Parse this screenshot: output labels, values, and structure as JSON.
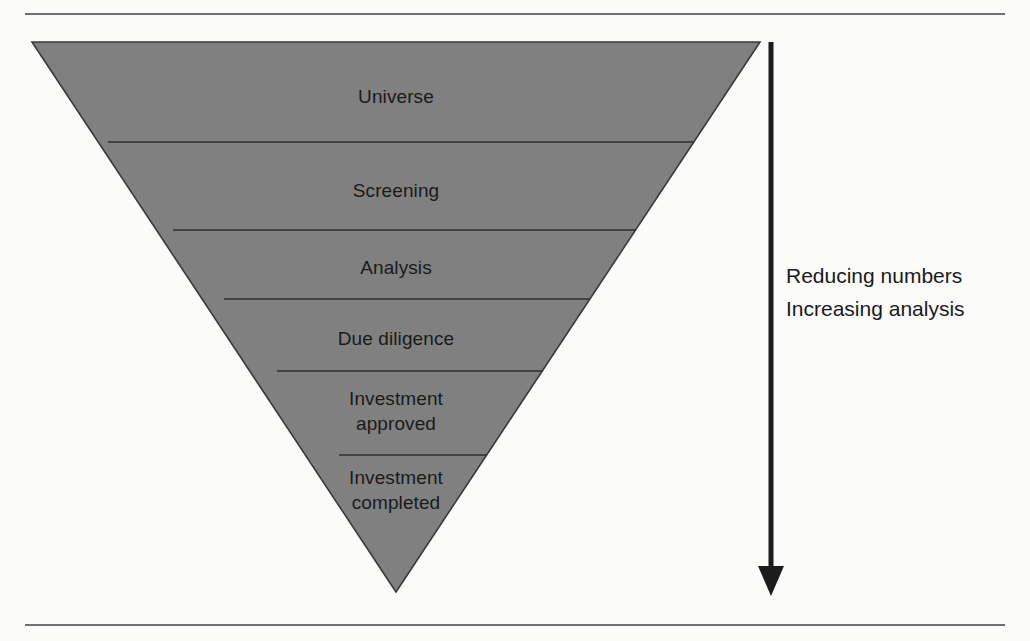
{
  "diagram": {
    "type": "inverted-funnel",
    "background_color": "#fbfbfa",
    "funnel_fill_color": "#808080",
    "funnel_stroke_color": "#333333",
    "rule_color": "#6f6f6f",
    "stages": [
      {
        "label": "Universe",
        "order": 1
      },
      {
        "label": "Screening",
        "order": 2
      },
      {
        "label": "Analysis",
        "order": 3
      },
      {
        "label": "Due diligence",
        "order": 4
      },
      {
        "label": "Investment\napproved",
        "order": 5
      },
      {
        "label": "Investment\ncompleted",
        "order": 6
      }
    ],
    "annotations": {
      "arrow_direction": "down",
      "lines": [
        "Reducing numbers",
        "Increasing analysis"
      ]
    }
  }
}
